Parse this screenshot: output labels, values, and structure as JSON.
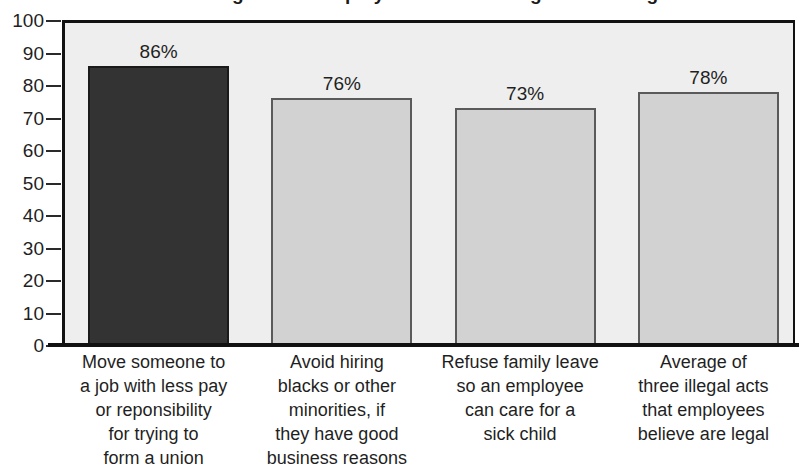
{
  "chart_data": {
    "type": "bar",
    "title": "What managers and employees believe is legal but is illegal",
    "xlabel": "",
    "ylabel": "",
    "ylim": [
      0,
      100
    ],
    "ytick_step": 10,
    "yticks": [
      100,
      90,
      80,
      70,
      60,
      50,
      40,
      30,
      20,
      10,
      0
    ],
    "grid": false,
    "legend": "none",
    "categories": [
      "Move someone to a job with less pay or reponsibility for trying to form a union",
      "Avoid hiring blacks or other minorities, if they have good business reasons",
      "Refuse family leave so an employee can care for a sick child",
      "Average of three illegal acts that employees believe are legal"
    ],
    "category_lines": [
      [
        "Move someone to",
        "a job with less pay",
        "or reponsibility",
        "for trying to",
        "form a union"
      ],
      [
        "Avoid hiring",
        "blacks or other",
        "minorities, if",
        "they have good",
        "business reasons"
      ],
      [
        "Refuse family leave",
        "so an employee",
        "can care for a",
        "sick child"
      ],
      [
        "Average of",
        "three illegal acts",
        "that employees",
        "believe are legal"
      ]
    ],
    "values": [
      86,
      76,
      73,
      78
    ],
    "value_labels": [
      "86%",
      "76%",
      "73%",
      "78%"
    ],
    "bar_colors": [
      "#333333",
      "#d2d2d2",
      "#d2d2d2",
      "#d2d2d2"
    ],
    "plot_background": "#eeeeee",
    "axis_color": "#111111"
  }
}
